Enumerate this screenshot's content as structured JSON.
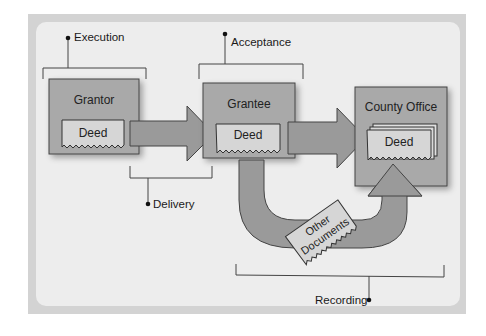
{
  "diagram": {
    "title": "",
    "nodes": {
      "grantor": {
        "label": "Grantor",
        "document": "Deed"
      },
      "grantee": {
        "label": "Grantee",
        "document": "Deed"
      },
      "county_office": {
        "label": "County Office",
        "document": "Deed"
      },
      "other_documents": {
        "label_line1": "Other",
        "label_line2": "Documents"
      }
    },
    "stages": {
      "execution": "Execution",
      "acceptance": "Acceptance",
      "delivery": "Delivery",
      "recording": "Recording"
    },
    "edges": [
      {
        "from": "grantor",
        "to": "grantee",
        "type": "arrow"
      },
      {
        "from": "grantee",
        "to": "county_office",
        "type": "arrow"
      },
      {
        "from": "grantee",
        "to": "county_office",
        "type": "u-arrow",
        "carries": "other_documents"
      }
    ],
    "colors": {
      "frame": "#d3d3d3",
      "background": "#ededed",
      "box_fill": "#a9a9a9",
      "arrow_fill": "#9a9a9a",
      "document_fill": "#d6d6d6",
      "stroke": "#3a3a3a"
    }
  }
}
